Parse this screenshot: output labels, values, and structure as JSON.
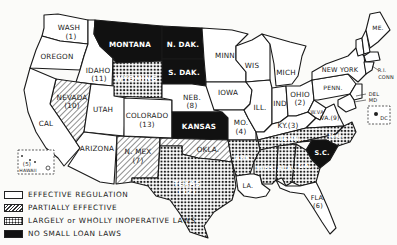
{
  "map": {
    "title": "",
    "colors": {
      "effective": "#ffffff",
      "partial_stroke": "#333333",
      "inoperative_dot": "#222222",
      "none": "#111111",
      "outline": "#1a1a1a"
    },
    "labels": {
      "wash": "WASH",
      "wash_num": "(1)",
      "oregon": "OREGON",
      "idaho": "IDAHO",
      "idaho_num": "(11)",
      "montana": "MONTANA",
      "ndak": "N. DAK.",
      "sdak": "S. DAK.",
      "wyoming": "WYOMING",
      "nevada": "NEVADA",
      "nevada_num": "(10)",
      "utah": "UTAH",
      "cal": "CAL",
      "colorado": "COLORADO",
      "colorado_num": "(13)",
      "neb": "NEB.",
      "neb_num": "(8)",
      "kansas": "KANSAS",
      "minn": "MINN",
      "iowa": "IOWA",
      "mo": "MO.",
      "mo_num": "(4)",
      "wis": "WIS",
      "mich": "MICH",
      "ill": "ILL.",
      "ind": "IND",
      "ohio": "OHIO",
      "ohio_num": "(2)",
      "ky": "KY.(3)",
      "wva": "W.VA.",
      "va": "VA.(9)",
      "penn": "PENN.",
      "newyork": "NEW YORK",
      "nj": "N.J.",
      "vt": "VT.",
      "nh": "N.H.",
      "me": "ME.",
      "mass": "MASS.",
      "ri": "R.I.",
      "conn": "CONN",
      "del": "DEL",
      "md": "MD",
      "dc": "DC",
      "arizona": "ARIZONA",
      "nmex": "N. MEX",
      "nmex_num": "(7)",
      "okla": "OKLA.",
      "texas": "TEXAS",
      "texas_num": "(12)",
      "ark": "ARK.",
      "tenn": "TENN.",
      "nc": "N.C.",
      "sc": "S.C.",
      "ga": "GA.",
      "ala": "ALA.",
      "miss": "MISS.",
      "la": "LA.",
      "fla": "FLA.",
      "fla_num": "(6)",
      "hawaii": "HAWAII",
      "hawaii_num": "(5)"
    },
    "categories": {
      "effective": [
        "WASH",
        "OREGON",
        "IDAHO",
        "UTAH",
        "CAL",
        "COLORADO",
        "NEB",
        "MINN",
        "IOWA",
        "MO",
        "WIS",
        "MICH",
        "ILL",
        "IND",
        "OHIO",
        "KY",
        "W.VA",
        "VA",
        "PENN",
        "NEW YORK",
        "N.J.",
        "VT",
        "N.H.",
        "ME",
        "MASS",
        "R.I.",
        "CONN",
        "DEL",
        "MD",
        "DC",
        "ARIZONA",
        "LA",
        "FLA",
        "HAWAII"
      ],
      "partially_effective": [
        "NEVADA",
        "N. MEX",
        "OKLA"
      ],
      "largely_or_wholly_inoperative": [
        "WYOMING",
        "TEXAS",
        "ARK",
        "TENN",
        "N.C.",
        "GA",
        "ALA",
        "MISS"
      ],
      "no_small_loan_laws": [
        "MONTANA",
        "N. DAK",
        "S. DAK",
        "KANSAS",
        "S.C."
      ]
    }
  },
  "legend": {
    "items": [
      {
        "key": "effective",
        "label": "EFFECTIVE REGULATION"
      },
      {
        "key": "partial",
        "label": "PARTIALLY EFFECTIVE"
      },
      {
        "key": "inoperative",
        "label": "LARGELY or WHOLLY INOPERATIVE LAWS"
      },
      {
        "key": "none",
        "label": "NO SMALL LOAN LAWS"
      }
    ]
  }
}
